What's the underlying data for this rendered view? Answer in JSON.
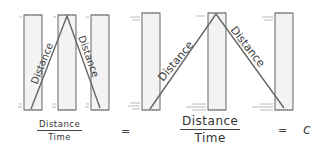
{
  "diagram": {
    "left_panel": {
      "path_labels": [
        "Distance",
        "Distance"
      ],
      "fraction": {
        "numerator": "Distance",
        "denominator": "Time"
      }
    },
    "equals_1": "=",
    "right_panel": {
      "path_labels": [
        "Distance",
        "Distance"
      ],
      "fraction": {
        "numerator": "Distance",
        "denominator": "Time"
      }
    },
    "equals_2": "=",
    "constant": "c",
    "colors": {
      "stroke": "#555555",
      "mirror_fill": "#f2f2f2",
      "path": "#666666"
    }
  }
}
